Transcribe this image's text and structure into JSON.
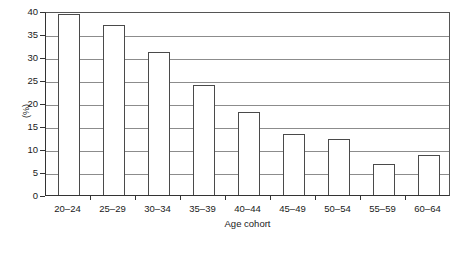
{
  "chart_data": {
    "type": "bar",
    "title": "",
    "xlabel": "Age cohort",
    "ylabel": "(%)",
    "categories": [
      "20–24",
      "25–29",
      "30–34",
      "35–39",
      "40–44",
      "45–49",
      "50–54",
      "55–59",
      "60–64"
    ],
    "values": [
      39.3,
      37.0,
      31.0,
      24.0,
      18.0,
      13.3,
      12.2,
      6.8,
      8.7
    ],
    "ylim": [
      0,
      40
    ],
    "yticks": [
      0,
      5,
      10,
      15,
      20,
      25,
      30,
      35,
      40
    ],
    "ytick_labels": [
      "0",
      "5",
      "10",
      "15",
      "20",
      "25",
      "30",
      "35",
      "40"
    ],
    "grid": true,
    "grid_axis": "y",
    "legend": false,
    "bar_face_color": "#ffffff",
    "bar_edge_color": "#4a4a4a",
    "grid_color": "#8c8c8c",
    "axis_color": "#333333"
  }
}
